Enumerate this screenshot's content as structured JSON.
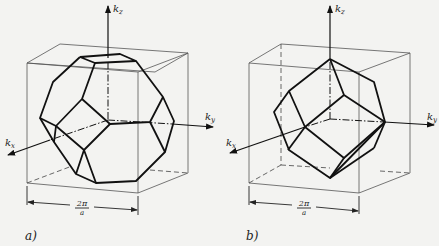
{
  "figure": {
    "panels": [
      {
        "id": "a",
        "caption": "a)",
        "shape": "truncated octahedron Brillouin zone",
        "axes": {
          "kz": "k",
          "kz_sub": "z",
          "ky": "k",
          "ky_sub": "y",
          "kx": "k",
          "kx_sub": "x"
        },
        "dimension": {
          "numerator": "2π",
          "denominator": "a"
        }
      },
      {
        "id": "b",
        "caption": "b)",
        "shape": "rhombic dodecahedron Brillouin zone",
        "axes": {
          "kz": "k",
          "kz_sub": "z",
          "ky": "k",
          "ky_sub": "y",
          "kx": "k",
          "kx_sub": "x"
        },
        "dimension": {
          "numerator": "2π",
          "denominator": "a"
        }
      }
    ]
  }
}
